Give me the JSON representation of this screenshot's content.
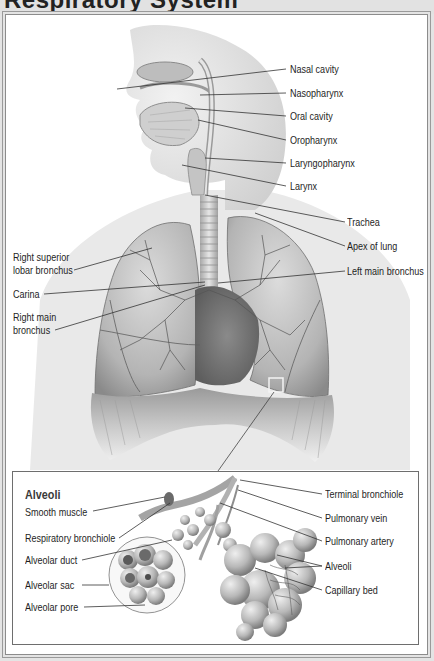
{
  "header": {
    "title": "Respiratory System",
    "title_visible": "partially cropped (descenders only)"
  },
  "main_labels": {
    "nasal_cavity": "Nasal cavity",
    "nasopharynx": "Nasopharynx",
    "oral_cavity": "Oral cavity",
    "oropharynx": "Oropharynx",
    "laryngopharynx": "Laryngopharynx",
    "larynx": "Larynx",
    "trachea": "Trachea",
    "apex_of_lung": "Apex of lung",
    "left_main_bronchus": "Left main bronchus",
    "right_superior_lobar_bronchus_1": "Right superior",
    "right_superior_lobar_bronchus_2": "lobar bronchus",
    "carina": "Carina",
    "right_main_bronchus_1": "Right main",
    "right_main_bronchus_2": "bronchus"
  },
  "inset": {
    "title": "Alveoli",
    "labels": {
      "smooth_muscle": "Smooth muscle",
      "respiratory_bronchiole": "Respiratory bronchiole",
      "alveolar_duct": "Alveolar duct",
      "alveolar_sac": "Alveolar sac",
      "alveolar_pore": "Alveolar pore",
      "terminal_bronchiole": "Terminal bronchiole",
      "pulmonary_vein": "Pulmonary vein",
      "pulmonary_artery": "Pulmonary artery",
      "alveoli": "Alveoli",
      "capillary_bed": "Capillary bed"
    }
  },
  "colors": {
    "background": "#e4e4e4",
    "panel": "#ffffff",
    "border": "#8c8c8c",
    "leader_line": "#333333",
    "tissue_light": "#d6d6d6",
    "tissue_dark": "#7a7a7a"
  }
}
